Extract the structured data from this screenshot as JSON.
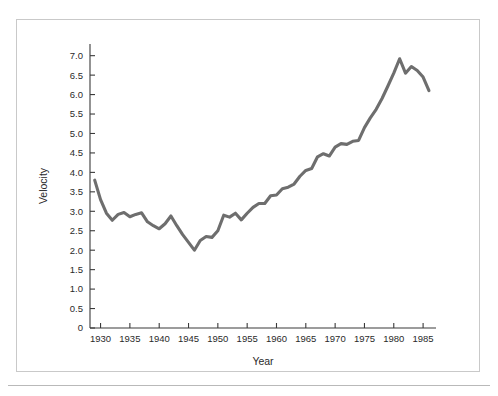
{
  "figure": {
    "frame_color": "#c9c9c9",
    "background": "#ffffff"
  },
  "chart_data": {
    "type": "line",
    "title": "",
    "subtitle": "",
    "xlabel": "Year",
    "ylabel": "Velocity",
    "xlim": [
      1928.2,
      1987.2
    ],
    "ylim": [
      0,
      7.3
    ],
    "xticks": [
      1930,
      1935,
      1940,
      1945,
      1950,
      1955,
      1960,
      1965,
      1970,
      1975,
      1980,
      1985
    ],
    "xtick_labels": [
      "1930",
      "1935",
      "1940",
      "1945",
      "1950",
      "1955",
      "1960",
      "1965",
      "1970",
      "1975",
      "1980",
      "1985"
    ],
    "yticks": [
      0,
      0.5,
      1.0,
      1.5,
      2.0,
      2.5,
      3.0,
      3.5,
      4.0,
      4.5,
      5.0,
      5.5,
      6.0,
      6.5,
      7.0
    ],
    "ytick_labels": [
      "0",
      "0.5",
      "1.0",
      "1.5",
      "2.0",
      "2.5",
      "3.0",
      "3.5",
      "4.0",
      "4.5",
      "5.0",
      "5.5",
      "6.0",
      "6.5",
      "7.0"
    ],
    "grid": false,
    "legend": false,
    "line_color": "#6e6e6e",
    "line_width": 3.1,
    "series": [
      {
        "name": "Velocity",
        "x": [
          1929,
          1930,
          1931,
          1932,
          1933,
          1934,
          1935,
          1936,
          1937,
          1938,
          1939,
          1940,
          1941,
          1942,
          1943,
          1944,
          1945,
          1946,
          1947,
          1948,
          1949,
          1950,
          1951,
          1952,
          1953,
          1954,
          1955,
          1956,
          1957,
          1958,
          1959,
          1960,
          1961,
          1962,
          1963,
          1964,
          1965,
          1966,
          1967,
          1968,
          1969,
          1970,
          1971,
          1972,
          1973,
          1974,
          1975,
          1976,
          1977,
          1978,
          1979,
          1980,
          1981,
          1982,
          1983,
          1984,
          1985,
          1986
        ],
        "values": [
          3.8,
          3.3,
          2.95,
          2.77,
          2.92,
          2.97,
          2.86,
          2.92,
          2.96,
          2.73,
          2.63,
          2.55,
          2.68,
          2.88,
          2.63,
          2.4,
          2.2,
          2.0,
          2.25,
          2.35,
          2.33,
          2.5,
          2.9,
          2.85,
          2.95,
          2.78,
          2.95,
          3.1,
          3.2,
          3.2,
          3.4,
          3.42,
          3.58,
          3.62,
          3.7,
          3.9,
          4.05,
          4.1,
          4.4,
          4.48,
          4.42,
          4.65,
          4.74,
          4.72,
          4.8,
          4.82,
          5.15,
          5.4,
          5.62,
          5.9,
          6.22,
          6.55,
          6.92,
          6.55,
          6.72,
          6.62,
          6.45,
          6.1
        ]
      }
    ]
  }
}
